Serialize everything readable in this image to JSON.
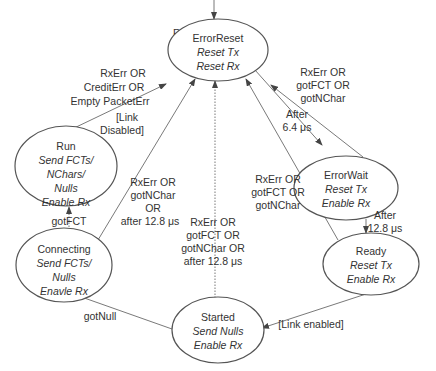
{
  "diagram": {
    "entry_label": "RESET",
    "states": {
      "error_reset": {
        "name": "ErrorReset",
        "action1": "Reset Tx",
        "action2": "Reset Rx"
      },
      "error_wait": {
        "name": "ErrorWait",
        "action1": "Reset Tx",
        "action2": "Enable Rx"
      },
      "ready": {
        "name": "Ready",
        "action1": "Reset Tx",
        "action2": "Enable Rx"
      },
      "started": {
        "name": "Started",
        "action1": "Send Nulls",
        "action2": "Enable Rx"
      },
      "connecting": {
        "name": "Connecting",
        "action1": "Send FCTs/",
        "action2": "Nulls",
        "action3": "Enavle Rx"
      },
      "run": {
        "name": "Run",
        "action1": "Send FCTs/",
        "action2": "NChars/",
        "action3": "Nulls",
        "action4": "Enable Rx"
      }
    },
    "transitions": {
      "run_to_error_reset": {
        "line1": "RxErr OR",
        "line2": "CreditErr OR",
        "line3": "Empty PacketErr",
        "line4": "[Link",
        "line5": "Disabled]"
      },
      "error_wait_to_error_reset": {
        "line1": "RxErr OR",
        "line2": "gotFCT OR",
        "line3": "gotNChar"
      },
      "error_reset_to_error_wait": {
        "line1": "After",
        "line2": "6.4 μs"
      },
      "connecting_to_error_reset": {
        "line1": "RxErr OR",
        "line2": "gotNChar",
        "line3": "OR",
        "line4": "after 12.8 μs"
      },
      "started_to_error_reset": {
        "line1": "RxErr OR",
        "line2": "gotFCT OR",
        "line3": "gotNChar OR",
        "line4": "after 12.8 μs"
      },
      "ready_to_error_reset": {
        "line1": "RxErr OR",
        "line2": "gotFCT OR",
        "line3": "gotNChar"
      },
      "error_wait_to_ready": {
        "line1": "After",
        "line2": "12.8 μs"
      },
      "connecting_to_run": {
        "line1": "gotFCT"
      },
      "started_to_connecting": {
        "line1": "gotNull"
      },
      "ready_to_started": {
        "line1": "[Link enabled]"
      }
    }
  }
}
